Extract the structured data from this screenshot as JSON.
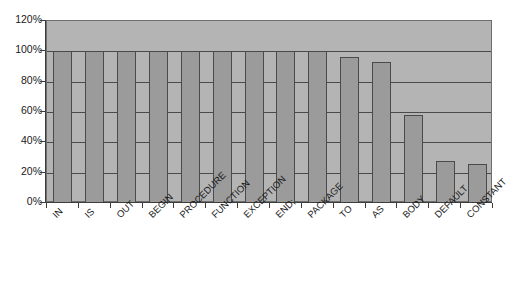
{
  "chart_data": {
    "type": "bar",
    "title": "",
    "subtitle": "",
    "xlabel": "",
    "ylabel": "",
    "categories": [
      "IN",
      "IS",
      "OUT",
      "BEGIN",
      "PROCEDURE",
      "FUNCTION",
      "EXCEPTION",
      "END;",
      "PACKAGE",
      "TO",
      "AS",
      "BODY",
      "DEFAULT",
      "CONSTANT"
    ],
    "values": [
      100,
      100,
      100,
      100,
      100,
      100,
      100,
      100,
      100,
      96,
      93,
      58,
      28,
      26
    ],
    "value_labels": [
      "100%",
      "100%",
      "100%",
      "100%",
      "100%",
      "100%",
      "100%",
      "100%",
      "100%",
      "96%",
      "93%",
      "58%",
      "28%",
      "26%"
    ],
    "ylim": [
      0,
      120
    ],
    "y_ticks": [
      0,
      20,
      40,
      60,
      80,
      100,
      120
    ],
    "y_tick_labels": [
      "0%",
      "20%",
      "40%",
      "60%",
      "80%",
      "100%",
      "120%"
    ],
    "grid": true,
    "grid_axis": "y",
    "legend": false,
    "legend_position": "none",
    "series": [
      {
        "name": "",
        "values": [
          100,
          100,
          100,
          100,
          100,
          100,
          100,
          100,
          100,
          96,
          93,
          58,
          28,
          26
        ]
      }
    ],
    "colors": {
      "bar_fill": "#9b9b9b",
      "bar_edge": "#4a4a4a",
      "plot_background": "#b4b4b4",
      "gridline": "#4a4a4a",
      "axis": "#3c3c3c",
      "text": "#1a1a1a",
      "canvas_background": "#ffffff"
    }
  }
}
